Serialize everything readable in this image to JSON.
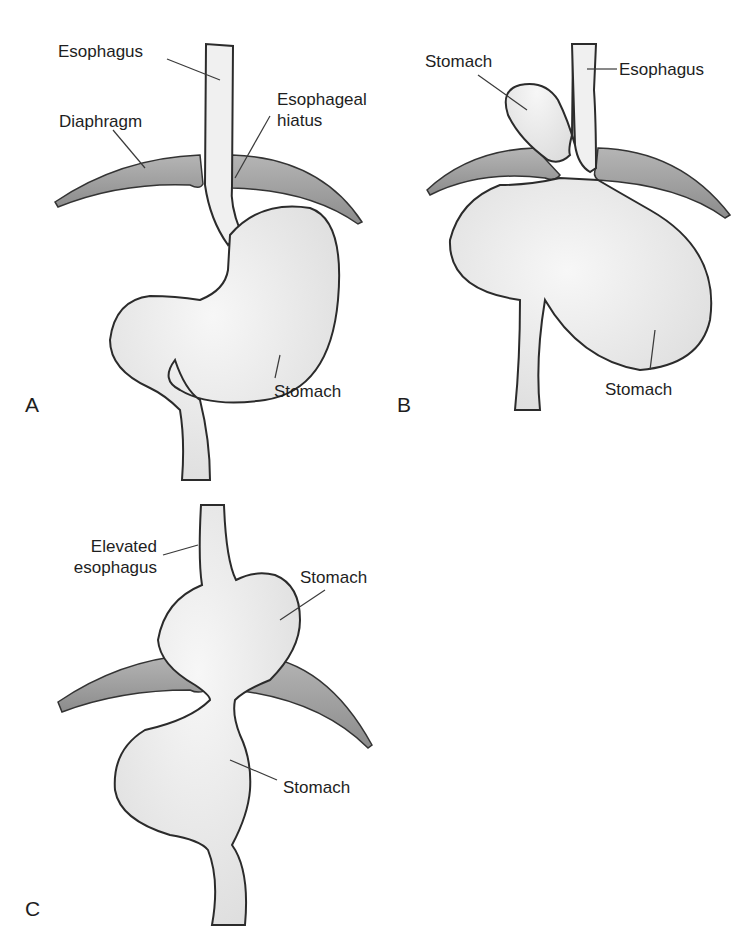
{
  "figure": {
    "panels": [
      {
        "letter": "A",
        "labels": {
          "esophagus": "Esophagus",
          "diaphragm": "Diaphragm",
          "hiatus_line1": "Esophageal",
          "hiatus_line2": "hiatus",
          "stomach": "Stomach"
        }
      },
      {
        "letter": "B",
        "labels": {
          "stomach_upper": "Stomach",
          "esophagus": "Esophagus",
          "stomach_lower": "Stomach"
        }
      },
      {
        "letter": "C",
        "labels": {
          "elevated_line1": "Elevated",
          "elevated_line2": "esophagus",
          "stomach_upper": "Stomach",
          "stomach_lower": "Stomach"
        }
      }
    ],
    "colors": {
      "outline": "#2b2b2b",
      "organ_fill": "#efefef",
      "diaphragm_fill": "#9a9a9a",
      "background": "#ffffff"
    }
  }
}
